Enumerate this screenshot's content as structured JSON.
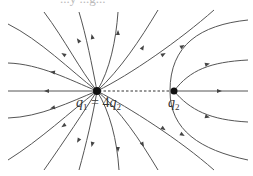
{
  "diagram": {
    "title_fragment": "...y ...g...",
    "type": "electric field lines of two positive point charges",
    "charges": [
      {
        "id": "q1",
        "name": "q",
        "sub": "1",
        "relation": "= 4",
        "rel_name": "q",
        "rel_sub": "2",
        "position": [
          97,
          91
        ],
        "field_lines": 16
      },
      {
        "id": "q2",
        "name": "q",
        "sub": "2",
        "position": [
          174,
          91
        ],
        "field_lines": 4
      }
    ],
    "connector": "dashed line between charges (neutral point region)",
    "colors": {
      "line": "#555555",
      "charge": "#111111",
      "background": "#ffffff"
    }
  }
}
